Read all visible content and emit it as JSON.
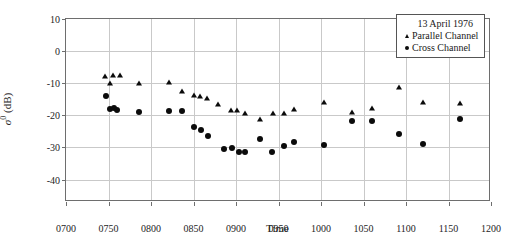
{
  "chart_data": {
    "type": "scatter",
    "title": "",
    "xlabel": "Time",
    "ylabel": "σ⁰ (dB)",
    "xlim": [
      700,
      1200
    ],
    "ylim": [
      -47,
      10
    ],
    "grid": true,
    "legend_position": "top-right",
    "legend_title": "13 April 1976",
    "xticks": [
      700,
      750,
      800,
      850,
      900,
      950,
      1000,
      1050,
      1100,
      1150,
      1200
    ],
    "xticklabels": [
      "0700",
      "0750",
      "0800",
      "0850",
      "0900",
      "0950",
      "1000",
      "1050",
      "1100",
      "1150",
      "1200"
    ],
    "yticks": [
      10,
      0,
      -10,
      -20,
      -30,
      -40
    ],
    "yticklabels": [
      "10",
      "0",
      "-10",
      "-20",
      "-30",
      "-40"
    ],
    "series": [
      {
        "name": "Parallel Channel",
        "marker": "triangle",
        "color": "#0b0b0b",
        "points": [
          [
            746,
            -7.6
          ],
          [
            752,
            -9.9
          ],
          [
            755,
            -7.5
          ],
          [
            763,
            -7.5
          ],
          [
            786,
            -9.9
          ],
          [
            821,
            -9.7
          ],
          [
            836,
            -12.5
          ],
          [
            851,
            -13.6
          ],
          [
            858,
            -14.1
          ],
          [
            866,
            -14.7
          ],
          [
            879,
            -16.5
          ],
          [
            894,
            -18.2
          ],
          [
            901,
            -18.2
          ],
          [
            911,
            -19.4
          ],
          [
            928,
            -21.2
          ],
          [
            943,
            -19.4
          ],
          [
            956,
            -19.3
          ],
          [
            968,
            -17.9
          ],
          [
            1004,
            -16.0
          ],
          [
            1036,
            -19.1
          ],
          [
            1060,
            -17.6
          ],
          [
            1092,
            -11.3
          ],
          [
            1120,
            -15.9
          ],
          [
            1163,
            -16.2
          ]
        ]
      },
      {
        "name": "Cross Channel",
        "marker": "circle",
        "color": "#0b0b0b",
        "points": [
          [
            747,
            -14.0
          ],
          [
            752,
            -18.0
          ],
          [
            756,
            -17.6
          ],
          [
            760,
            -18.4
          ],
          [
            786,
            -18.9
          ],
          [
            821,
            -18.8
          ],
          [
            836,
            -18.7
          ],
          [
            851,
            -23.6
          ],
          [
            859,
            -24.5
          ],
          [
            867,
            -26.5
          ],
          [
            886,
            -30.4
          ],
          [
            895,
            -30.3
          ],
          [
            903,
            -31.3
          ],
          [
            911,
            -31.3
          ],
          [
            928,
            -27.3
          ],
          [
            942,
            -31.3
          ],
          [
            956,
            -29.5
          ],
          [
            968,
            -28.2
          ],
          [
            1004,
            -29.3
          ],
          [
            1036,
            -21.8
          ],
          [
            1060,
            -21.7
          ],
          [
            1092,
            -25.7
          ],
          [
            1120,
            -28.9
          ],
          [
            1163,
            -21.3
          ]
        ]
      }
    ]
  }
}
